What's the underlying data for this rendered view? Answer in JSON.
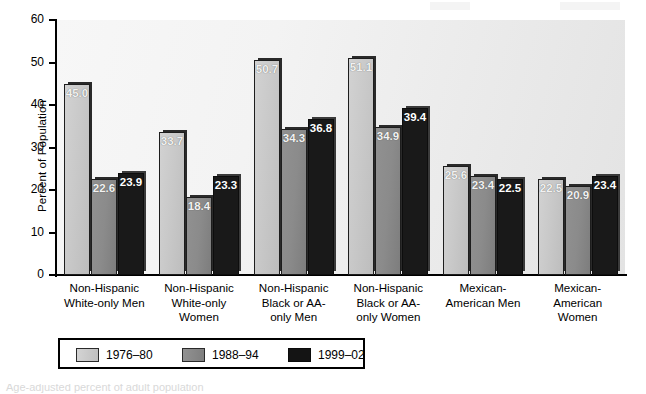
{
  "chart_data": {
    "type": "bar",
    "title": "",
    "xlabel": "",
    "ylabel": "Percent of Population",
    "ylim": [
      0,
      60
    ],
    "yticks": [
      "0",
      "10",
      "20",
      "30",
      "40",
      "50",
      "60"
    ],
    "grid": false,
    "legend_position": "bottom-left",
    "categories": [
      "Non-Hispanic White-only Men",
      "Non-Hispanic White-only Women",
      "Non-Hispanic Black or AA-only Men",
      "Non-Hispanic Black or AA-only Women",
      "Mexican-American Men",
      "Mexican-American Women"
    ],
    "category_label_lines": [
      [
        "Non-Hispanic",
        "White-only Men"
      ],
      [
        "Non-Hispanic",
        "White-only",
        "Women"
      ],
      [
        "Non-Hispanic",
        "Black or AA-",
        "only Men"
      ],
      [
        "Non-Hispanic",
        "Black or AA-",
        "only Women"
      ],
      [
        "Mexican-",
        "American Men"
      ],
      [
        "Mexican-",
        "American",
        "Women"
      ]
    ],
    "series": [
      {
        "name": "1976–80",
        "color": "#c9c9c9",
        "values": [
          45.0,
          33.7,
          50.7,
          51.1,
          25.6,
          22.5
        ],
        "labels": [
          "45.0",
          "33.7",
          "50.7",
          "51.1",
          "25.6",
          "22.5"
        ]
      },
      {
        "name": "1988–94",
        "color": "#8b8b8b",
        "values": [
          22.6,
          18.4,
          34.3,
          34.9,
          23.4,
          20.9
        ],
        "labels": [
          "22.6",
          "18.4",
          "34.3",
          "34.9",
          "23.4",
          "20.9"
        ]
      },
      {
        "name": "1999–02",
        "color": "#191919",
        "values": [
          23.9,
          23.3,
          36.8,
          39.4,
          22.5,
          23.4
        ],
        "labels": [
          "23.9",
          "23.3",
          "36.8",
          "39.4",
          "22.5",
          "23.4"
        ]
      }
    ]
  },
  "legend": {
    "items": [
      {
        "label": "1976–80",
        "swatch": "light-gray-swatch"
      },
      {
        "label": "1988–94",
        "swatch": "medium-gray-swatch"
      },
      {
        "label": "1999–02",
        "swatch": "black-swatch"
      }
    ]
  },
  "caption": {
    "text": "Age-adjusted percent of adult population"
  }
}
